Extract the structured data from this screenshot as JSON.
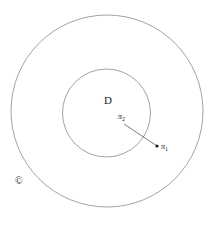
{
  "figure": {
    "background_color": "#ffffff",
    "stroke_color": "#8a8a8a",
    "text_color": "#1a1a1a",
    "width": 218,
    "height": 230,
    "labels": {
      "outer_region": "©",
      "outer_region_meaning": "C",
      "inner_region": "D",
      "point_tail": "π",
      "point_tail_sub": "2",
      "point_head": "π",
      "point_head_sub": "1"
    },
    "shapes": {
      "outer_circle": {
        "cx": 107,
        "cy": 111,
        "r": 96,
        "stroke_width": 0.8
      },
      "inner_circle": {
        "cx": 106.5,
        "cy": 113,
        "r": 44,
        "stroke_width": 0.8
      },
      "arrow": {
        "x1": 124,
        "y1": 124,
        "x2": 157,
        "y2": 146,
        "stroke_width": 0.8,
        "head_radius": 1.6
      }
    },
    "label_positions": {
      "outer_region": {
        "x": 15,
        "y": 178
      },
      "inner_region": {
        "x": 104,
        "y": 100
      },
      "point_tail": {
        "x": 118,
        "y": 117
      },
      "point_head": {
        "x": 161,
        "y": 146
      }
    }
  }
}
